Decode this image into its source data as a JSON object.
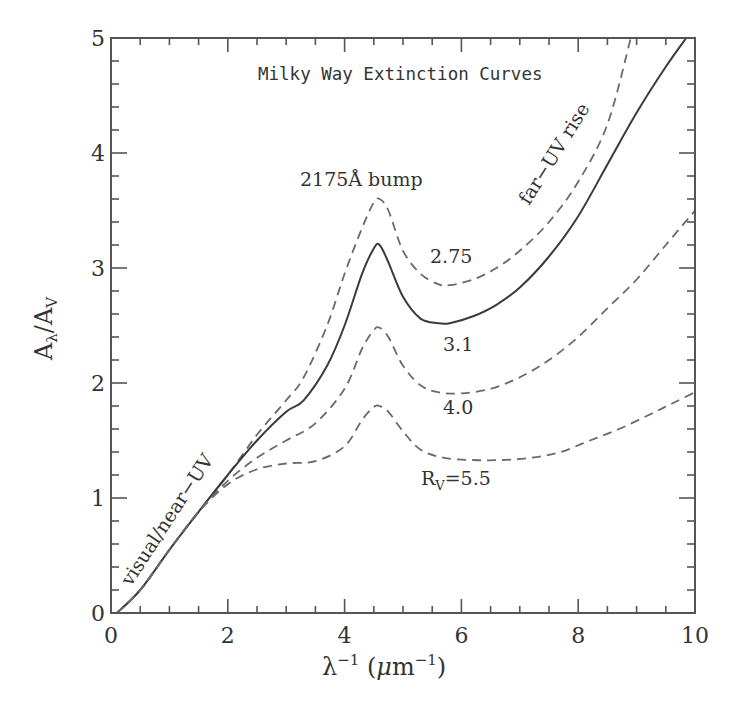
{
  "chart_data": {
    "type": "line",
    "title": "Milky Way Extinction Curves",
    "xlabel": "λ⁻¹ (μm⁻¹)",
    "ylabel": "Aλ/AV",
    "xlim": [
      0,
      10
    ],
    "ylim": [
      0,
      5
    ],
    "xticks": [
      0,
      2,
      4,
      6,
      8,
      10
    ],
    "xtick_labels": [
      "0",
      "2",
      "4",
      "6",
      "8",
      "10"
    ],
    "yticks": [
      0,
      1,
      2,
      3,
      4,
      5
    ],
    "ytick_labels": [
      "0",
      "1",
      "2",
      "3",
      "4",
      "5"
    ],
    "x_minor_step": 0.5,
    "y_minor_step": 0.2,
    "grid": false,
    "legend": "inline labels",
    "series": [
      {
        "name": "RV=2.75",
        "style": "dashed",
        "x": [
          0.1,
          0.5,
          1.0,
          1.5,
          2.0,
          2.5,
          3.0,
          3.3,
          3.7,
          4.0,
          4.3,
          4.5,
          4.6,
          4.75,
          5.0,
          5.3,
          5.6,
          5.8,
          6.2,
          6.6,
          7.0,
          7.5,
          8.0,
          8.5,
          8.9
        ],
        "y": [
          0.0,
          0.2,
          0.55,
          0.88,
          1.2,
          1.55,
          1.85,
          2.05,
          2.5,
          2.95,
          3.35,
          3.57,
          3.6,
          3.5,
          3.15,
          2.95,
          2.86,
          2.85,
          2.9,
          3.0,
          3.15,
          3.4,
          3.75,
          4.25,
          5.0
        ]
      },
      {
        "name": "RV=3.1",
        "style": "solid",
        "x": [
          0.1,
          0.5,
          1.0,
          1.5,
          2.0,
          2.5,
          3.0,
          3.3,
          3.7,
          4.0,
          4.3,
          4.5,
          4.6,
          4.75,
          5.0,
          5.3,
          5.6,
          5.8,
          6.2,
          6.6,
          7.0,
          7.5,
          8.0,
          8.5,
          9.0,
          9.5,
          9.85
        ],
        "y": [
          0.0,
          0.2,
          0.55,
          0.88,
          1.2,
          1.5,
          1.75,
          1.85,
          2.15,
          2.5,
          2.95,
          3.17,
          3.2,
          3.05,
          2.75,
          2.56,
          2.52,
          2.52,
          2.58,
          2.68,
          2.83,
          3.1,
          3.45,
          3.9,
          4.35,
          4.75,
          5.0
        ]
      },
      {
        "name": "RV=4.0",
        "style": "dashed",
        "x": [
          0.1,
          0.5,
          1.0,
          1.5,
          2.0,
          2.5,
          3.0,
          3.5,
          4.0,
          4.3,
          4.5,
          4.6,
          4.75,
          5.0,
          5.3,
          5.6,
          6.0,
          6.5,
          7.0,
          7.5,
          8.0,
          8.5,
          9.0,
          9.5,
          10.0
        ],
        "y": [
          0.0,
          0.2,
          0.55,
          0.88,
          1.15,
          1.35,
          1.5,
          1.65,
          1.95,
          2.3,
          2.46,
          2.48,
          2.4,
          2.15,
          1.98,
          1.92,
          1.91,
          1.95,
          2.05,
          2.2,
          2.4,
          2.65,
          2.9,
          3.2,
          3.5
        ]
      },
      {
        "name": "RV=5.5",
        "style": "dashed",
        "x": [
          0.1,
          0.5,
          1.0,
          1.5,
          2.0,
          2.5,
          3.0,
          3.5,
          4.0,
          4.3,
          4.5,
          4.6,
          4.75,
          5.0,
          5.3,
          5.7,
          6.2,
          6.7,
          7.2,
          7.7,
          8.2,
          8.7,
          9.2,
          9.6,
          10.0
        ],
        "y": [
          0.0,
          0.2,
          0.55,
          0.88,
          1.12,
          1.25,
          1.3,
          1.32,
          1.45,
          1.68,
          1.79,
          1.8,
          1.75,
          1.58,
          1.42,
          1.35,
          1.33,
          1.33,
          1.35,
          1.4,
          1.5,
          1.6,
          1.72,
          1.82,
          1.92
        ]
      }
    ],
    "annotations": [
      {
        "text": "2175Å bump",
        "x": 3.3,
        "y": 3.8,
        "rotate": 0
      },
      {
        "text": "far-UV rise",
        "x": 6.8,
        "y": 3.7,
        "rotate": -58
      },
      {
        "text": "visual/near-UV",
        "x": 0.35,
        "y": 0.3,
        "rotate": -57
      },
      {
        "text": "2.75",
        "x": 5.55,
        "y": 3.1,
        "rotate": 0
      },
      {
        "text": "3.1",
        "x": 5.8,
        "y": 2.28,
        "rotate": 0
      },
      {
        "text": "4.0",
        "x": 5.75,
        "y": 1.68,
        "rotate": 0
      },
      {
        "text": "RV=5.5",
        "x": 5.3,
        "y": 1.0,
        "rotate": 0
      }
    ]
  },
  "labels": {
    "title": "Milky Way Extinction Curves",
    "xlabel_main": "λ",
    "xlabel_sup": "−1",
    "xlabel_unit_open": " (",
    "xlabel_mu": "μ",
    "xlabel_m": "m",
    "xlabel_unit_sup": "−1",
    "xlabel_close": ")",
    "ylabel_A1": "A",
    "ylabel_sub1": "λ",
    "ylabel_slash": "/",
    "ylabel_A2": "A",
    "ylabel_sub2": "V",
    "bump": "2175Å bump",
    "far_uv": "far−UV rise",
    "visual": "visual/near−UV",
    "rv_275": "2.75",
    "rv_31": "3.1",
    "rv_40": "4.0",
    "rv_55_R": "R",
    "rv_55_sub": "V",
    "rv_55_val": "=5.5"
  },
  "colors": {
    "axis": "#555555",
    "solid_line": "#3a3a3a",
    "dashed_line": "#6a6a6a",
    "text": "#333333",
    "background": "#ffffff"
  }
}
